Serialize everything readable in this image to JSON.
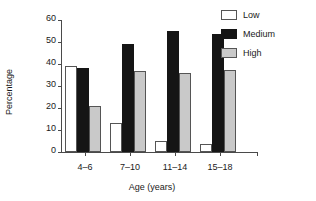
{
  "chart_data": {
    "type": "bar",
    "title": "",
    "xlabel": "Age (years)",
    "ylabel": "Percentage",
    "categories": [
      "4–6",
      "7–10",
      "11–14",
      "15–18"
    ],
    "series": [
      {
        "name": "Low",
        "color": "#ffffff",
        "values": [
          39,
          13,
          5,
          3.5
        ]
      },
      {
        "name": "Medium",
        "color": "#151515",
        "values": [
          38,
          49,
          55,
          53.5
        ]
      },
      {
        "name": "High",
        "color": "#c9c9c9",
        "values": [
          21,
          37,
          36,
          37.5
        ]
      }
    ],
    "ylim": [
      0,
      60
    ],
    "yticks": [
      0,
      10,
      20,
      30,
      40,
      50,
      60
    ],
    "ytick_labels": [
      "0",
      "10",
      "20",
      "30",
      "40",
      "50",
      "60"
    ],
    "grid": false,
    "legend_position": "top-right",
    "legend_entries": [
      "Low",
      "Medium",
      "High"
    ]
  }
}
